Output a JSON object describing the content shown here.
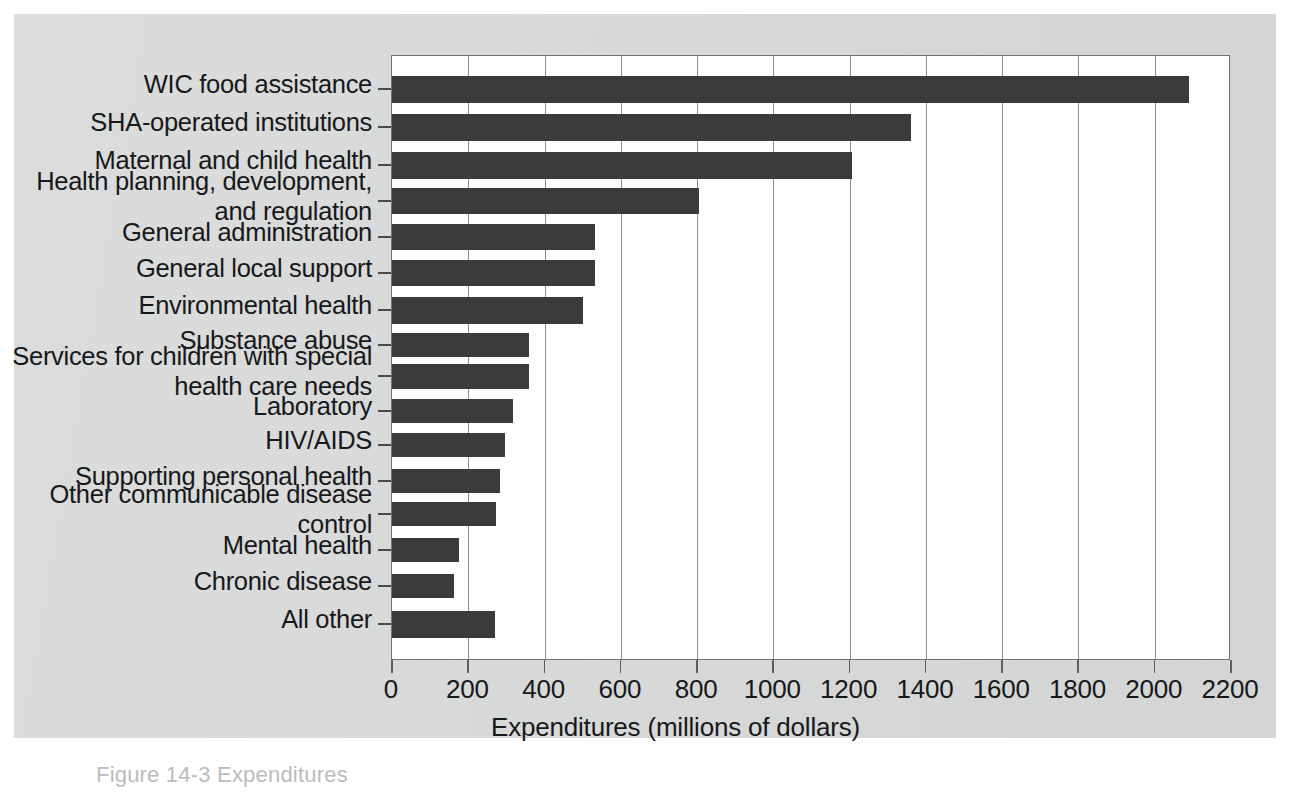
{
  "figure": {
    "caption": "Figure 14-3   Expenditures",
    "bar_color": "#3b3b3b",
    "background_color": "#d7d8d8",
    "plot_background_color": "#fefefe"
  },
  "chart_data": {
    "type": "bar",
    "orientation": "horizontal",
    "title": "",
    "xlabel": "Expenditures (millions of dollars)",
    "ylabel": "",
    "xlim": [
      0,
      2200
    ],
    "xticks": [
      0,
      200,
      400,
      600,
      800,
      1000,
      1200,
      1400,
      1600,
      1800,
      2000,
      2200
    ],
    "xtick_labels": [
      "0",
      "200",
      "400",
      "600",
      "800",
      "1000",
      "1200",
      "1400",
      "1600",
      "1800",
      "2000",
      "2200"
    ],
    "grid": "vertical",
    "legend": null,
    "categories": [
      "WIC food assistance",
      "SHA-operated institutions",
      "Maternal and child health",
      "Health planning, development,\nand regulation",
      "General administration",
      "General local support",
      "Environmental health",
      "Substance abuse",
      "Services for children with special\nhealth care needs",
      "Laboratory",
      "HIV/AIDS",
      "Supporting personal health",
      "Other communicable disease\ncontrol",
      "Mental health",
      "Chronic disease",
      "All other"
    ],
    "values": [
      2090,
      1360,
      1205,
      805,
      532,
      532,
      500,
      358,
      358,
      317,
      296,
      283,
      272,
      176,
      163,
      270
    ],
    "value_unit": "millions of dollars"
  },
  "labels": {
    "c0": "WIC food assistance",
    "c1": "SHA-operated institutions",
    "c2": "Maternal and child health",
    "c3": "Health planning, development,\nand regulation",
    "c4": "General administration",
    "c5": "General local support",
    "c6": "Environmental health",
    "c7": "Substance abuse",
    "c8": "Services for children with special\nhealth care needs",
    "c9": "Laboratory",
    "c10": "HIV/AIDS",
    "c11": "Supporting personal health",
    "c12": "Other communicable disease\ncontrol",
    "c13": "Mental health",
    "c14": "Chronic disease",
    "c15": "All other"
  },
  "xticklabels": {
    "t0": "0",
    "t1": "200",
    "t2": "400",
    "t3": "600",
    "t4": "800",
    "t5": "1000",
    "t6": "1200",
    "t7": "1400",
    "t8": "1600",
    "t9": "1800",
    "t10": "2000",
    "t11": "2200"
  },
  "axis": {
    "x_title": "Expenditures (millions of dollars)"
  }
}
